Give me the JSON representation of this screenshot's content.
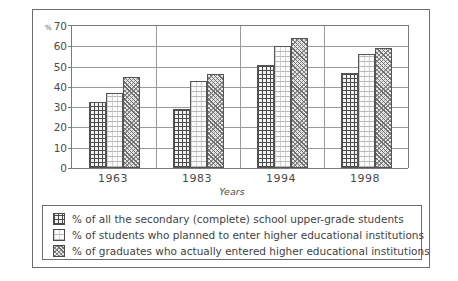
{
  "chart_data": {
    "type": "bar",
    "title": "",
    "xlabel": "Years",
    "ylabel": "%",
    "categories": [
      "1963",
      "1983",
      "1994",
      "1998"
    ],
    "ylim": [
      0,
      70
    ],
    "yticks": [
      70,
      60,
      50,
      40,
      30,
      20,
      10,
      0
    ],
    "grid": true,
    "legend_position": "bottom",
    "series": [
      {
        "name": "% of all the secondary (complete) school upper-grade students",
        "pattern": "cross-hatch",
        "values": [
          32.5,
          29,
          51,
          47
        ]
      },
      {
        "name": "% of students who planned to enter higher educational institutions",
        "pattern": "light-dotted",
        "values": [
          37,
          43,
          60,
          56
        ]
      },
      {
        "name": "% of graduates who actually entered higher educational institutions",
        "pattern": "diagonal-hatch",
        "values": [
          45,
          46.5,
          64,
          59
        ]
      }
    ]
  },
  "axis": {
    "percent_symbol": "%",
    "tick_70": "70",
    "tick_60": "60",
    "tick_50": "50",
    "tick_40": "40",
    "tick_30": "30",
    "tick_20": "20",
    "tick_10": "10",
    "tick_0": "0",
    "x_title": "Years",
    "x_1": "1963",
    "x_2": "1983",
    "x_3": "1994",
    "x_4": "1998"
  },
  "legend": {
    "item_1": "% of all the secondary (complete) school upper-grade students",
    "item_2": "% of students who planned to enter higher educational institutions",
    "item_3": "% of graduates who actually entered higher educational institutions"
  },
  "colors": {
    "frame": "#6d6d6d",
    "gridline": "#9a9a9a",
    "axis": "#7a7a7a",
    "text": "#4a4a4a"
  }
}
